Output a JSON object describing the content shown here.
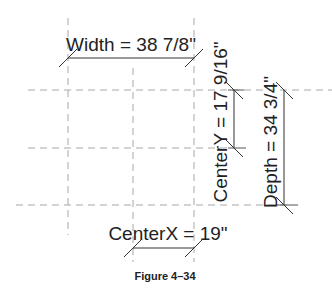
{
  "figure": {
    "caption": "Figure 4–34",
    "dimensions": {
      "width": {
        "label": "Width = 38 7/8\""
      },
      "center_y": {
        "label": "CenterY = 17 9/16\""
      },
      "depth": {
        "label": "Depth = 34 3/4\""
      },
      "center_x": {
        "label": "CenterX = 19\""
      }
    },
    "grid": {
      "vertical_lines": 3,
      "horizontal_lines": 3
    },
    "colors": {
      "grid_line": "#a8a8a8",
      "dimension_line": "#333333",
      "text": "#222222"
    }
  }
}
